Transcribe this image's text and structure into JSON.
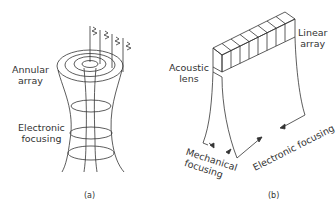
{
  "panels": [
    {
      "id": "a",
      "caption": "(a)",
      "labels": {
        "annular_array_l1": "Annular",
        "annular_array_l2": "array",
        "electronic_focusing_l1": "Electronic",
        "electronic_focusing_l2": "focusing"
      }
    },
    {
      "id": "b",
      "caption": "(b)",
      "labels": {
        "linear_array_l1": "Linear",
        "linear_array_l2": "array",
        "acoustic_lens_l1": "Acoustic",
        "acoustic_lens_l2": "lens",
        "mechanical_focusing_l1": "Mechanical",
        "mechanical_focusing_l2": "focusing",
        "electronic_focusing": "Electronic focusing"
      }
    }
  ],
  "colors": {
    "line": "#333333",
    "text": "#333333",
    "background": "#ffffff"
  }
}
